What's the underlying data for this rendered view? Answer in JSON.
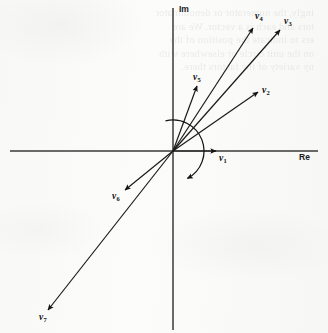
{
  "figure": {
    "kind": "phasor-diagram",
    "width": 328,
    "height": 333,
    "background_color": "#fbfbfa",
    "ink_color": "#1a1a1a"
  },
  "axes": {
    "origin": {
      "x": 173,
      "y": 151
    },
    "real": {
      "label": "Re",
      "label_pos": {
        "x": 299,
        "y": 153
      },
      "x_start": 10,
      "x_end": 318,
      "y": 151
    },
    "imaginary": {
      "label": "Im",
      "label_pos": {
        "x": 179,
        "y": 5
      },
      "y_start": 8,
      "y_end": 330,
      "x": 173
    }
  },
  "rotation_arc": {
    "name": "rotation-arc",
    "radius": 31,
    "start_angle_deg": 104,
    "end_angle_deg": -62,
    "direction": "counterclockwise",
    "arrow_at": "end"
  },
  "vectors": [
    {
      "id": "v1",
      "label": "v",
      "subscript": "1",
      "tip": {
        "x": 216,
        "y": 151
      },
      "label_pos": {
        "x": 219,
        "y": 154
      },
      "angle_deg": 0,
      "length": 43
    },
    {
      "id": "v2",
      "label": "v",
      "subscript": "2",
      "tip": {
        "x": 258,
        "y": 92
      },
      "label_pos": {
        "x": 262,
        "y": 86
      },
      "angle_deg": 54,
      "length": 103
    },
    {
      "id": "v3",
      "label": "v",
      "subscript": "3",
      "tip": {
        "x": 280,
        "y": 30
      },
      "label_pos": {
        "x": 284,
        "y": 17
      },
      "angle_deg": 66,
      "length": 167
    },
    {
      "id": "v4",
      "label": "v",
      "subscript": "4",
      "tip": {
        "x": 253,
        "y": 28
      },
      "label_pos": {
        "x": 255,
        "y": 12
      },
      "angle_deg": 72,
      "length": 135
    },
    {
      "id": "v5",
      "label": "v",
      "subscript": "5",
      "tip": {
        "x": 197,
        "y": 86
      },
      "label_pos": {
        "x": 193,
        "y": 73
      },
      "angle_deg": 70,
      "length": 69
    },
    {
      "id": "v6",
      "label": "v",
      "subscript": "6",
      "tip": {
        "x": 125,
        "y": 190
      },
      "label_pos": {
        "x": 112,
        "y": 192
      },
      "angle_deg": -141,
      "length": 62
    },
    {
      "id": "v7",
      "label": "v",
      "subscript": "7",
      "tip": {
        "x": 48,
        "y": 310
      },
      "label_pos": {
        "x": 39,
        "y": 313
      },
      "angle_deg": -132,
      "length": 199
    }
  ],
  "bleed_through_lines": [
    "ingly, the numerator or denominator",
    "tors and each is a vector. We are",
    "ers to indicate the position of the",
    "on the unit circle or elsewhere with",
    "ny variety of the factors there."
  ]
}
